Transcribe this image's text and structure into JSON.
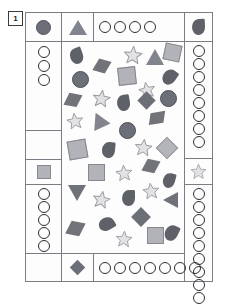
{
  "page": {
    "label": "1"
  },
  "colors": {
    "frame_border": "#7c7c85",
    "shape_dark": "#6c6e78",
    "shape_darker": "#5f6169",
    "shape_light": "#b2b3b8",
    "star_fill": "#e2e2e4",
    "star_stroke": "#9a9ba1",
    "outline_circle": "#2f2f33",
    "background": "#ffffff"
  },
  "layout": {
    "type": "shape-counting-worksheet",
    "description": "Bordered frame with a central scatter field of geometric shapes surrounded by border cells containing single key shapes and rows/columns of empty tally circles."
  },
  "cells": {
    "top_left_key": {
      "name": "filled-circle-key",
      "shape": "circle-filled",
      "count_label": ""
    },
    "top_triangle_key": {
      "name": "triangle-key",
      "shape": "triangle-up"
    },
    "top_tally_row": {
      "name": "top-circle-tally",
      "shape": "circle-open",
      "count": 4
    },
    "top_right_key": {
      "name": "droplet-key",
      "shape": "droplet"
    },
    "left_tally_upper": {
      "name": "left-circle-tally-upper",
      "shape": "circle-open",
      "count": 3
    },
    "left_blank": {
      "name": "left-blank-cell",
      "shape": "none",
      "count": 0
    },
    "left_square_key": {
      "name": "square-key",
      "shape": "square-filled"
    },
    "left_tally_lower": {
      "name": "left-circle-tally-lower",
      "shape": "circle-open",
      "count": 6
    },
    "left_bottom_blank": {
      "name": "left-bottom-blank-cell",
      "shape": "none",
      "count": 0
    },
    "right_tally_upper": {
      "name": "right-circle-tally-upper",
      "shape": "circle-open",
      "count": 8
    },
    "right_star_key": {
      "name": "star-key",
      "shape": "star"
    },
    "right_tally_lower": {
      "name": "right-circle-tally-lower",
      "shape": "circle-open",
      "count": 9
    },
    "bottom_diamond_key": {
      "name": "diamond-key",
      "shape": "diamond"
    },
    "bottom_tally_row": {
      "name": "bottom-circle-tally",
      "shape": "circle-open",
      "count": 7
    }
  },
  "scatter_field": {
    "name": "shape-scatter-field",
    "shape_types": [
      "circle",
      "triangle",
      "square",
      "star",
      "droplet",
      "diamond",
      "rhombus"
    ],
    "total_shapes": 43,
    "shapes": [
      {
        "id": 1,
        "type": "droplet",
        "tone": "dark",
        "x": 8,
        "y": 6,
        "size": 16,
        "rot": -20
      },
      {
        "id": 2,
        "type": "rhombus",
        "tone": "dark",
        "x": 33,
        "y": 18,
        "size": 14,
        "rot": 15
      },
      {
        "id": 3,
        "type": "star",
        "tone": "light",
        "x": 61,
        "y": 3,
        "size": 18,
        "rot": 5
      },
      {
        "id": 4,
        "type": "triangle",
        "tone": "dark",
        "x": 84,
        "y": 7,
        "size": 16,
        "rot": 0
      },
      {
        "id": 5,
        "type": "square",
        "tone": "light",
        "x": 102,
        "y": 2,
        "size": 17,
        "rot": 12
      },
      {
        "id": 6,
        "type": "circle",
        "tone": "dark",
        "x": 10,
        "y": 29,
        "size": 17,
        "rot": 0
      },
      {
        "id": 7,
        "type": "square",
        "tone": "light",
        "x": 56,
        "y": 25,
        "size": 18,
        "rot": -6
      },
      {
        "id": 8,
        "type": "droplet",
        "tone": "dark",
        "x": 101,
        "y": 27,
        "size": 16,
        "rot": 35
      },
      {
        "id": 9,
        "type": "star",
        "tone": "light",
        "x": 76,
        "y": 39,
        "size": 16,
        "rot": -12
      },
      {
        "id": 10,
        "type": "rhombus",
        "tone": "dark",
        "x": 4,
        "y": 52,
        "size": 14,
        "rot": 10
      },
      {
        "id": 11,
        "type": "star",
        "tone": "light",
        "x": 30,
        "y": 47,
        "size": 17,
        "rot": 8
      },
      {
        "id": 12,
        "type": "droplet",
        "tone": "dark",
        "x": 55,
        "y": 53,
        "size": 16,
        "rot": -10
      },
      {
        "id": 13,
        "type": "diamond",
        "tone": "dark",
        "x": 78,
        "y": 52,
        "size": 13,
        "rot": 0
      },
      {
        "id": 14,
        "type": "circle",
        "tone": "dark",
        "x": 98,
        "y": 48,
        "size": 17,
        "rot": 0
      },
      {
        "id": 15,
        "type": "star",
        "tone": "light",
        "x": 4,
        "y": 70,
        "size": 16,
        "rot": -8
      },
      {
        "id": 16,
        "type": "triangle",
        "tone": "dark",
        "x": 28,
        "y": 70,
        "size": 16,
        "rot": -25
      },
      {
        "id": 17,
        "type": "rhombus",
        "tone": "dark",
        "x": 88,
        "y": 70,
        "size": 14,
        "rot": -10
      },
      {
        "id": 18,
        "type": "circle",
        "tone": "dark",
        "x": 57,
        "y": 80,
        "size": 17,
        "rot": 0
      },
      {
        "id": 19,
        "type": "square",
        "tone": "light",
        "x": 6,
        "y": 98,
        "size": 19,
        "rot": -10
      },
      {
        "id": 20,
        "type": "droplet",
        "tone": "dark",
        "x": 40,
        "y": 100,
        "size": 16,
        "rot": 5
      },
      {
        "id": 21,
        "type": "star",
        "tone": "light",
        "x": 72,
        "y": 96,
        "size": 17,
        "rot": 6
      },
      {
        "id": 22,
        "type": "diamond",
        "tone": "light",
        "x": 97,
        "y": 98,
        "size": 16,
        "rot": 0
      },
      {
        "id": 23,
        "type": "square",
        "tone": "light",
        "x": 26,
        "y": 122,
        "size": 17,
        "rot": 0
      },
      {
        "id": 24,
        "type": "star",
        "tone": "light",
        "x": 53,
        "y": 122,
        "size": 16,
        "rot": -5
      },
      {
        "id": 25,
        "type": "rhombus",
        "tone": "dark",
        "x": 82,
        "y": 118,
        "size": 14,
        "rot": 12
      },
      {
        "id": 26,
        "type": "droplet",
        "tone": "dark",
        "x": 101,
        "y": 131,
        "size": 15,
        "rot": 15
      },
      {
        "id": 27,
        "type": "triangle-down",
        "tone": "dark",
        "x": 6,
        "y": 143,
        "size": 16,
        "rot": 0
      },
      {
        "id": 28,
        "type": "star",
        "tone": "light",
        "x": 30,
        "y": 148,
        "size": 17,
        "rot": 10
      },
      {
        "id": 29,
        "type": "droplet",
        "tone": "dark",
        "x": 60,
        "y": 148,
        "size": 16,
        "rot": 0
      },
      {
        "id": 30,
        "type": "star",
        "tone": "light",
        "x": 80,
        "y": 140,
        "size": 16,
        "rot": -6
      },
      {
        "id": 31,
        "type": "triangle-right",
        "tone": "dark",
        "x": 101,
        "y": 150,
        "size": 15,
        "rot": 0
      },
      {
        "id": 32,
        "type": "diamond",
        "tone": "dark",
        "x": 72,
        "y": 168,
        "size": 14,
        "rot": 0
      },
      {
        "id": 33,
        "type": "droplet",
        "tone": "dark",
        "x": 38,
        "y": 174,
        "size": 16,
        "rot": 60
      },
      {
        "id": 34,
        "type": "rhombus",
        "tone": "dark",
        "x": 6,
        "y": 180,
        "size": 15,
        "rot": 10
      },
      {
        "id": 35,
        "type": "star",
        "tone": "light",
        "x": 53,
        "y": 188,
        "size": 16,
        "rot": 4
      },
      {
        "id": 36,
        "type": "square",
        "tone": "light",
        "x": 85,
        "y": 185,
        "size": 17,
        "rot": 0
      },
      {
        "id": 37,
        "type": "droplet",
        "tone": "dark",
        "x": 103,
        "y": 183,
        "size": 16,
        "rot": 25
      }
    ]
  }
}
